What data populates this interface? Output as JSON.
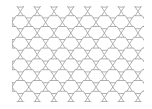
{
  "figure": {
    "title": "",
    "type": "hexagonal-grid"
  },
  "canvas": {
    "width": 152,
    "height": 109,
    "background_color": "#ffffff"
  },
  "frame": {
    "x": 12,
    "y": 6,
    "width": 132,
    "height": 96,
    "border_color": "#c8c8c8",
    "border_width": 1,
    "fill_color": "#ffffff"
  },
  "grid": {
    "orientation": "flat-top",
    "rows": 9,
    "columns": 9,
    "hex_width": 16.8,
    "hex_height": 13.0,
    "col_pitch": 16.8,
    "row_pitch": 10.8,
    "row_offset": 8.4,
    "origin_x": 12,
    "origin_y": 6,
    "line_color": "#808080",
    "line_width": 0.6,
    "cell_fill": "#ffffff"
  },
  "legend": {
    "visible": false,
    "entries": []
  },
  "axes": {
    "visible": false,
    "x_ticks": [],
    "y_ticks": []
  }
}
